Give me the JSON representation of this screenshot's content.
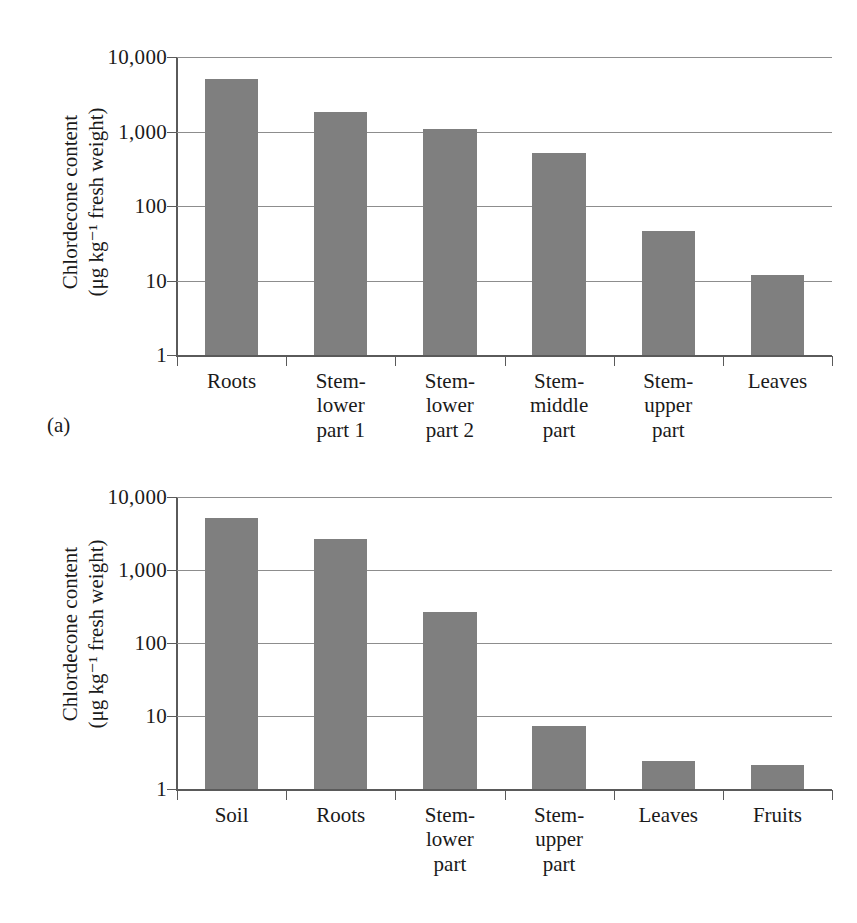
{
  "figure": {
    "background_color": "#ffffff",
    "bar_color": "#7f7f7f",
    "axis_color": "#5a5a5a",
    "gridline_color": "#8d8d8d"
  },
  "panels": [
    {
      "letter": "(a)",
      "ytitle": "Chlordecone content\n(μg kg⁻¹ fresh weight)",
      "yticks": [
        "10,000",
        "1,000",
        "100",
        "10",
        "1"
      ]
    },
    {
      "letter": "(b)",
      "ytitle": "Chlordecone content\n(μg kg⁻¹ fresh weight)",
      "yticks": [
        "10,000",
        "1,000",
        "100",
        "10",
        "1"
      ]
    }
  ],
  "chart_data": [
    {
      "type": "bar",
      "panel": "(a)",
      "title": "",
      "xlabel": "",
      "ylabel": "Chlordecone content (μg kg⁻¹ fresh weight)",
      "yscale": "log",
      "ylim": [
        1,
        10000
      ],
      "ytick_values": [
        10000,
        1000,
        100,
        10,
        1
      ],
      "ytick_labels": [
        "10,000",
        "1,000",
        "100",
        "10",
        "1"
      ],
      "grid": true,
      "legend": false,
      "categories": [
        "Roots",
        "Stem-\nlower\npart 1",
        "Stem-\nlower\npart 2",
        "Stem-\nmiddle\npart",
        "Stem-\nupper\npart",
        "Leaves"
      ],
      "values": [
        5000,
        1800,
        1080,
        520,
        46,
        12
      ]
    },
    {
      "type": "bar",
      "panel": "(b)",
      "title": "",
      "xlabel": "",
      "ylabel": "Chlordecone content (μg kg⁻¹ fresh weight)",
      "yscale": "log",
      "ylim": [
        1,
        10000
      ],
      "ytick_values": [
        10000,
        1000,
        100,
        10,
        1
      ],
      "ytick_labels": [
        "10,000",
        "1,000",
        "100",
        "10",
        "1"
      ],
      "grid": true,
      "legend": false,
      "categories": [
        "Soil",
        "Roots",
        "Stem-\nlower\npart",
        "Stem-\nupper\npart",
        "Leaves",
        "Fruits"
      ],
      "values": [
        5100,
        2700,
        270,
        7.3,
        2.4,
        2.1
      ]
    }
  ]
}
